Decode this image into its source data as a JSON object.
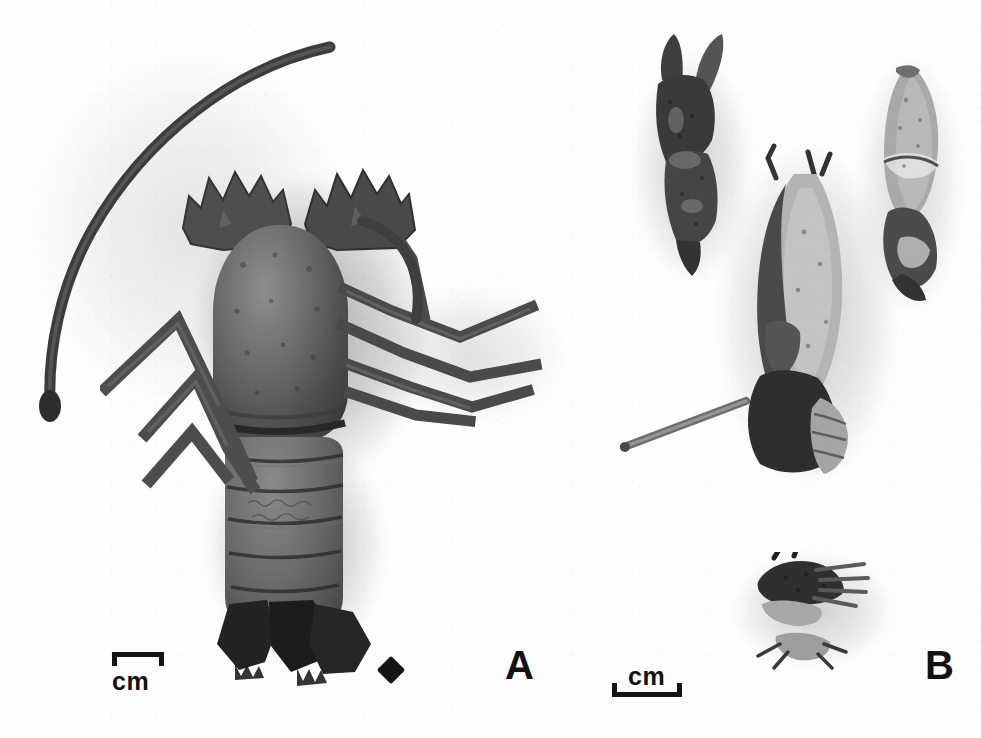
{
  "figure": {
    "kind": "specimen-photograph-plate",
    "background_color": "#fefefe",
    "ink_color": "#141414",
    "width_px": 981,
    "height_px": 738
  },
  "panels": [
    {
      "id": "A",
      "letter": "A",
      "letter_position": {
        "x": 805,
        "y": 645
      },
      "description": "Whole spiny lobster specimen, dorsal view, with one long curved antenna",
      "marker": {
        "name": "diamond-marker",
        "glyph": "◆",
        "position": {
          "x": 381,
          "y": 660
        }
      },
      "scale_bar": {
        "label": "cm",
        "label_position": "below",
        "ticks": "down",
        "position": {
          "x": 112,
          "y": 652
        },
        "length_px": 52
      },
      "specimen_parts": [
        "antenna",
        "rostrum-horns",
        "carapace",
        "abdomen-segments",
        "tail-fan",
        "pereiopods-left",
        "pereiopods-right"
      ]
    },
    {
      "id": "B",
      "letter": "B",
      "letter_position": {
        "x": 925,
        "y": 645
      },
      "description": "Dissected appendages and body fragments of the specimen",
      "scale_bar": {
        "label": "cm",
        "label_position": "above",
        "ticks": "up",
        "position": {
          "x": 612,
          "y": 690
        },
        "length_px": 70
      },
      "specimen_parts": [
        "left-chela-claw",
        "central-body-fragment",
        "right-elongate-fragment",
        "lower-appendage-cluster"
      ]
    }
  ],
  "labels": {
    "scale_unit": "cm",
    "panel_a": "A",
    "panel_b": "B",
    "diamond": "◆"
  }
}
